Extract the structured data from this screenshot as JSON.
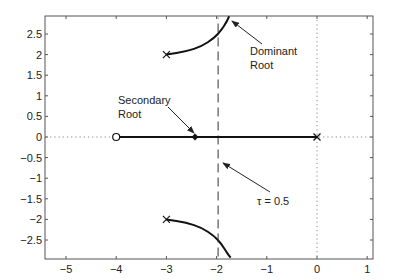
{
  "chart_data": {
    "type": "line",
    "title": "",
    "xlabel": "",
    "ylabel": "",
    "xlim": [
      -5.4,
      1.15
    ],
    "ylim": [
      -2.9,
      2.9
    ],
    "grid": false,
    "x_ticks": [
      -5,
      -4,
      -3,
      -2,
      -1,
      0,
      1
    ],
    "x_tick_labels": [
      "−5",
      "−4",
      "−3",
      "−2",
      "−1",
      "0",
      "1"
    ],
    "y_ticks": [
      2.5,
      2,
      1.5,
      1,
      0.5,
      0,
      -0.5,
      -1,
      -1.5,
      -2,
      -2.5
    ],
    "y_tick_labels": [
      "2.5",
      "2",
      "1.5",
      "1",
      "0.5",
      "0",
      "−0.5",
      "−1",
      "−1.5",
      "−2",
      "−2.5"
    ],
    "series": [
      {
        "name": "upper-branch",
        "style": "solid-thick",
        "x": [
          -3.0,
          -2.6,
          -2.3,
          -2.05,
          -1.9,
          -1.8,
          -1.75
        ],
        "y": [
          2.0,
          2.08,
          2.2,
          2.4,
          2.6,
          2.8,
          2.93
        ]
      },
      {
        "name": "lower-branch",
        "style": "solid-thick",
        "x": [
          -3.0,
          -2.6,
          -2.3,
          -2.05,
          -1.9,
          -1.8,
          -1.72
        ],
        "y": [
          -2.0,
          -2.08,
          -2.2,
          -2.4,
          -2.6,
          -2.8,
          -2.93
        ]
      },
      {
        "name": "real-axis-branch",
        "style": "solid-thick",
        "x": [
          -4.0,
          0.0
        ],
        "y": [
          0,
          0
        ]
      },
      {
        "name": "real-axis-dotted",
        "style": "dotted",
        "x": [
          -5.4,
          1.15
        ],
        "y": [
          0,
          0
        ]
      },
      {
        "name": "imag-axis-dotted",
        "style": "dotted",
        "x": [
          0,
          0
        ],
        "y": [
          -2.9,
          2.9
        ]
      },
      {
        "name": "tau-boundary",
        "style": "dashed",
        "x": [
          -1.97,
          -1.97
        ],
        "y": [
          -2.9,
          2.9
        ]
      }
    ],
    "markers": [
      {
        "type": "x",
        "x": -3,
        "y": 2,
        "label": "pole"
      },
      {
        "type": "x",
        "x": -3,
        "y": -2,
        "label": "pole"
      },
      {
        "type": "x",
        "x": 0,
        "y": 0,
        "label": "pole"
      },
      {
        "type": "o",
        "x": -4,
        "y": 0,
        "label": "zero"
      },
      {
        "type": "diamond",
        "x": -2.43,
        "y": 0,
        "label": "secondary root"
      }
    ],
    "annotations": [
      {
        "text_lines": [
          "Dominant",
          "Root"
        ],
        "text_x": -1.0,
        "text_y": 1.8,
        "arrow_to": [
          -1.7,
          2.4
        ]
      },
      {
        "text_lines": [
          "Secondary",
          "Root"
        ],
        "text_x": -3.0,
        "text_y": 0.7,
        "arrow_to": [
          -2.45,
          0.05
        ]
      },
      {
        "text": "τ = 0.5",
        "text_x": -1.2,
        "text_y": -0.75,
        "arrow_to": [
          -1.9,
          -0.2
        ]
      }
    ]
  },
  "labels": {
    "dominant_line1": "Dominant",
    "dominant_line2": "Root",
    "secondary_line1": "Secondary",
    "secondary_line2": "Root",
    "tau": "τ = 0.5"
  }
}
